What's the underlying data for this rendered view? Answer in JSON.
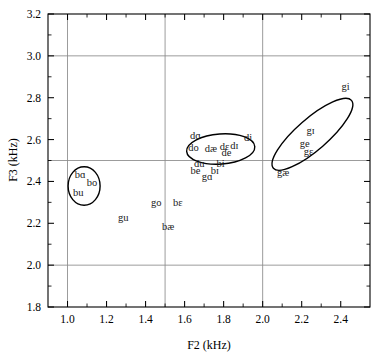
{
  "chart_data": {
    "type": "scatter",
    "title": "",
    "xlabel": "F2 (kHz)",
    "ylabel": "F3 (kHz)",
    "xlim": [
      0.9,
      2.55
    ],
    "ylim": [
      1.8,
      3.2
    ],
    "xticks": [
      1.0,
      1.2,
      1.4,
      1.6,
      1.8,
      2.0,
      2.2,
      2.4
    ],
    "xticklabels": [
      "1.0",
      "1.2",
      "1.4",
      "1.6",
      "1.8",
      "2.0",
      "2.2",
      "2.4"
    ],
    "yticks": [
      1.8,
      2.0,
      2.2,
      2.4,
      2.6,
      2.8,
      3.0,
      3.2
    ],
    "yticklabels": [
      "1.8",
      "2.0",
      "2.2",
      "2.4",
      "2.6",
      "2.8",
      "3.0",
      "3.2"
    ],
    "xgridlines": [
      1.0,
      1.5,
      2.0
    ],
    "ygridlines": [
      2.0,
      2.5,
      3.0
    ],
    "grid": true,
    "legend": "none",
    "points": [
      {
        "label": "bɑ",
        "x": 1.065,
        "y": 2.415
      },
      {
        "label": "bo",
        "x": 1.125,
        "y": 2.378
      },
      {
        "label": "bu",
        "x": 1.055,
        "y": 2.328
      },
      {
        "label": "gu",
        "x": 1.285,
        "y": 2.213
      },
      {
        "label": "go",
        "x": 1.455,
        "y": 2.283
      },
      {
        "label": "bɛ",
        "x": 1.565,
        "y": 2.283
      },
      {
        "label": "bæ",
        "x": 1.515,
        "y": 2.168
      },
      {
        "label": "dɑ",
        "x": 1.655,
        "y": 2.605
      },
      {
        "label": "do",
        "x": 1.645,
        "y": 2.545
      },
      {
        "label": "dæ",
        "x": 1.735,
        "y": 2.543
      },
      {
        "label": "dɛ",
        "x": 1.805,
        "y": 2.548
      },
      {
        "label": "dɪ",
        "x": 1.855,
        "y": 2.553
      },
      {
        "label": "de",
        "x": 1.815,
        "y": 2.52
      },
      {
        "label": "di",
        "x": 1.925,
        "y": 2.592
      },
      {
        "label": "du",
        "x": 1.675,
        "y": 2.468
      },
      {
        "label": "bi",
        "x": 1.785,
        "y": 2.468
      },
      {
        "label": "be",
        "x": 1.655,
        "y": 2.437
      },
      {
        "label": "bɪ",
        "x": 1.755,
        "y": 2.437
      },
      {
        "label": "gɑ",
        "x": 1.715,
        "y": 2.405
      },
      {
        "label": "gi",
        "x": 2.425,
        "y": 2.838
      },
      {
        "label": "gɪ",
        "x": 2.245,
        "y": 2.625
      },
      {
        "label": "ge",
        "x": 2.215,
        "y": 2.565
      },
      {
        "label": "gɛ",
        "x": 2.235,
        "y": 2.528
      },
      {
        "label": "gæ",
        "x": 2.105,
        "y": 2.425
      }
    ],
    "ellipses": [
      {
        "name": "b-back-vowels",
        "cx": 1.085,
        "cy": 2.378,
        "rx": 0.082,
        "ry": 0.092,
        "rotation": 0
      },
      {
        "name": "d-cluster",
        "cx": 1.785,
        "cy": 2.555,
        "rx": 0.175,
        "ry": 0.072,
        "rotation": -4
      },
      {
        "name": "g-front-vowels",
        "cx": 2.255,
        "cy": 2.625,
        "rx": 0.265,
        "ry": 0.075,
        "rotation": -41
      }
    ]
  }
}
